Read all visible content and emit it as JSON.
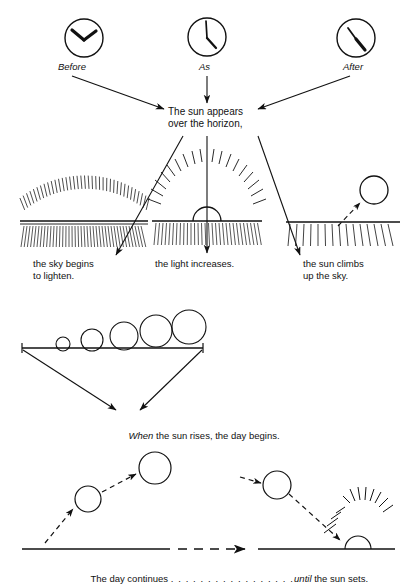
{
  "page": {
    "title": "The sun appears over the horizon",
    "background_color": "#ffffff",
    "ink_color": "#111111",
    "width": 414,
    "height": 585
  },
  "clocks": {
    "items": [
      {
        "id": "clock-before",
        "label": "Before",
        "cx": 84,
        "cy": 38,
        "r": 19,
        "hour_angle_deg": 300,
        "minute_angle_deg": 40,
        "reading": "hands form an inverted V pointing up"
      },
      {
        "id": "clock-as",
        "label": "As",
        "cx": 207,
        "cy": 37,
        "r": 19,
        "hour_angle_deg": 130,
        "minute_angle_deg": 355,
        "reading": "minute hand near 12, hour hand near 4"
      },
      {
        "id": "clock-after",
        "label": "After",
        "cx": 356,
        "cy": 38,
        "r": 19,
        "hour_angle_deg": 140,
        "minute_angle_deg": 340,
        "reading": "hour hand down-right, minute hand up-left"
      }
    ]
  },
  "center_caption": {
    "line1": "The sun appears",
    "line2": "over the horizon,"
  },
  "scenes": {
    "items": [
      {
        "id": "scene-sky-lightens",
        "caption_line1": "the sky begins",
        "caption_line2": "to lighten.",
        "art": "arc of radiating hatch above horizon, dense vertical hatch below"
      },
      {
        "id": "scene-light-increases",
        "caption_line1": "the light increases.",
        "caption_line2": "",
        "art": "half sun on horizon with radiating rays, hatch below"
      },
      {
        "id": "scene-sun-climbs",
        "caption_line1": "the sun climbs",
        "caption_line2": "up the sky.",
        "art": "circle above horizon with dashed arrow, hatch below"
      }
    ]
  },
  "rise_sequence": {
    "caption_italic": "When",
    "caption_rest": " the sun rises, the day begins.",
    "circles": [
      {
        "cx": 63,
        "cy": 344,
        "r": 7
      },
      {
        "cx": 92,
        "cy": 340,
        "r": 11
      },
      {
        "cx": 124,
        "cy": 336,
        "r": 14
      },
      {
        "cx": 156,
        "cy": 331,
        "r": 16
      },
      {
        "cx": 189,
        "cy": 327,
        "r": 17
      }
    ],
    "baseline_y": 348,
    "baseline_x1": 22,
    "baseline_x2": 203
  },
  "day_arc": {
    "caption_part1": "The day continues ",
    "caption_dots": ". . . . . . . . . . . . . . . . .",
    "caption_italic": "until",
    "caption_part2": " the sun sets.",
    "circles": [
      {
        "id": "sun-morning",
        "cx": 88,
        "cy": 499,
        "r": 13
      },
      {
        "id": "sun-noon",
        "cx": 155,
        "cy": 468,
        "r": 16
      },
      {
        "id": "sun-afternoon",
        "cx": 277,
        "cy": 485,
        "r": 14
      },
      {
        "id": "sun-setting",
        "cx": 358,
        "cy": 549,
        "r": 13
      }
    ],
    "horizon_y": 549,
    "horizon_x1": 22,
    "horizon_x2": 395
  }
}
